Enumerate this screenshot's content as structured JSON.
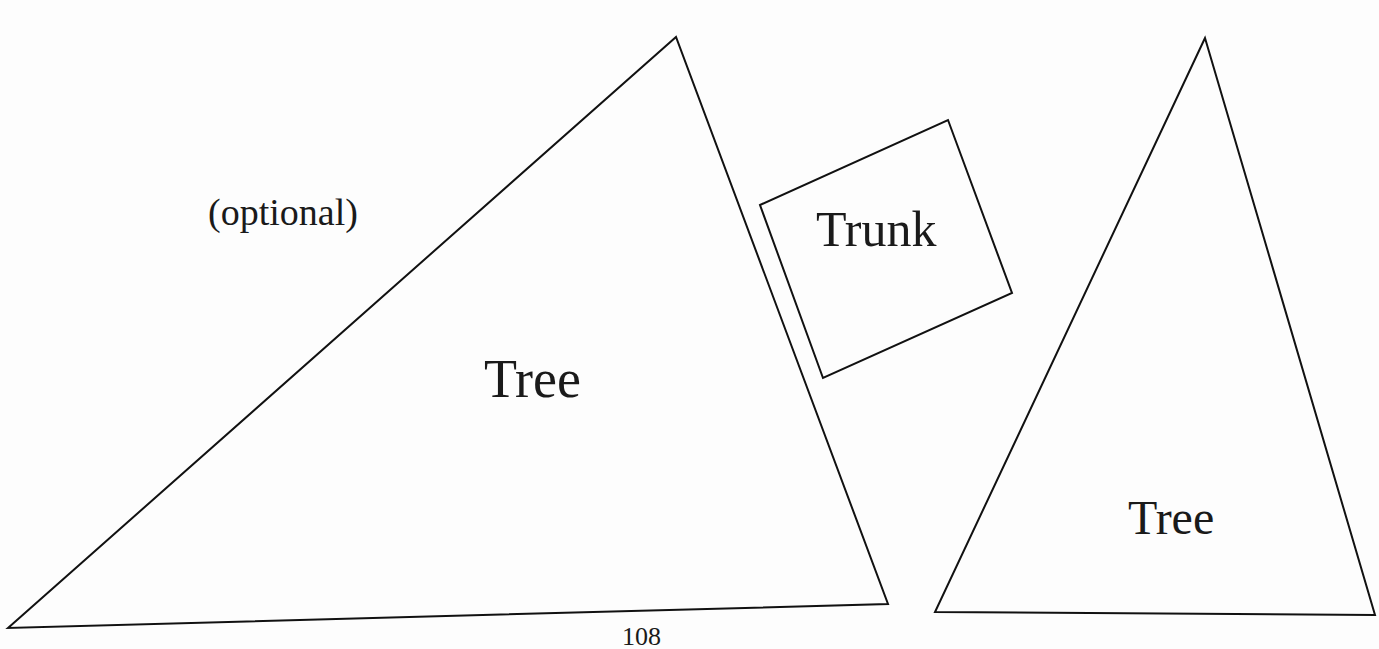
{
  "shapes": {
    "left_tree": {
      "label": "Tree",
      "note": "(optional)",
      "points": "8,628 676,37 888,604"
    },
    "trunk": {
      "label": "Trunk",
      "points": "760,205 948,120 1012,293 823,378"
    },
    "right_tree": {
      "label": "Tree",
      "points": "1205,38 935,612 1375,615"
    }
  },
  "page_number": "108",
  "colors": {
    "stroke": "#111111",
    "background": "#fdfdfd"
  }
}
